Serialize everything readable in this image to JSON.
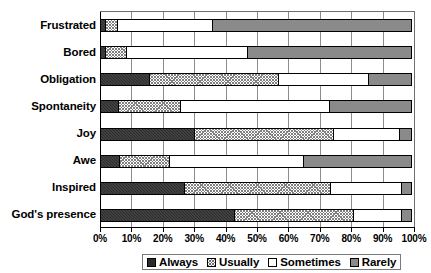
{
  "chart_data": {
    "type": "bar",
    "orientation": "horizontal",
    "stacked": true,
    "stack_mode": "percent",
    "title": "",
    "xlabel": "",
    "ylabel": "",
    "xlim": [
      0,
      100
    ],
    "grid": true,
    "legend_position": "bottom",
    "categories": [
      "Frustrated",
      "Bored",
      "Obligation",
      "Spontaneity",
      "Joy",
      "Awe",
      "Inspired",
      "God's presence"
    ],
    "xticks": [
      0,
      10,
      20,
      30,
      40,
      50,
      60,
      70,
      80,
      90,
      100
    ],
    "xticklabels": [
      "0%",
      "10%",
      "20%",
      "30%",
      "40%",
      "50%",
      "60%",
      "70%",
      "80%",
      "90%",
      "100%"
    ],
    "series": [
      {
        "name": "Always",
        "fill": "solid-dark",
        "color": "#2b2b2b",
        "values": [
          2,
          2,
          16,
          6,
          30,
          6.5,
          27,
          43
        ]
      },
      {
        "name": "Usually",
        "fill": "crosshatch",
        "color": "#ffffff",
        "values": [
          4,
          7,
          41,
          20,
          44.5,
          16,
          46.5,
          38
        ]
      },
      {
        "name": "Sometimes",
        "fill": "white",
        "color": "#ffffff",
        "values": [
          30.5,
          38.5,
          29,
          47.5,
          21.5,
          43,
          23,
          15.5
        ]
      },
      {
        "name": "Rarely",
        "fill": "gray",
        "color": "#8a8a8a",
        "values": [
          63.5,
          52.5,
          14,
          26.5,
          4,
          34.5,
          3.5,
          3.5
        ]
      }
    ]
  },
  "legend": {
    "items": [
      {
        "label": "Always",
        "key": "always"
      },
      {
        "label": "Usually",
        "key": "usually"
      },
      {
        "label": "Sometimes",
        "key": "sometimes"
      },
      {
        "label": "Rarely",
        "key": "rarely"
      }
    ]
  }
}
